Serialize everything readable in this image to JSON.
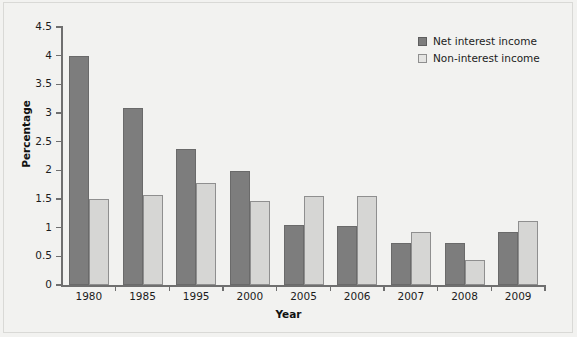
{
  "chart_data": {
    "type": "bar",
    "title": "",
    "xlabel": "Year",
    "ylabel": "Percentage",
    "categories": [
      "1980",
      "1985",
      "1995",
      "2000",
      "2005",
      "2006",
      "2007",
      "2008",
      "2009"
    ],
    "series": [
      {
        "name": "Net interest income",
        "color": "#7d7d7d",
        "values": [
          4.0,
          3.08,
          2.38,
          1.98,
          1.05,
          1.03,
          0.74,
          0.73,
          0.92
        ]
      },
      {
        "name": "Non-interest income",
        "color": "#d6d6d4",
        "values": [
          1.5,
          1.57,
          1.78,
          1.47,
          1.56,
          1.56,
          0.93,
          0.43,
          1.12
        ]
      }
    ],
    "ylim": [
      0,
      4.5
    ],
    "yticks": [
      "0",
      "0.5",
      "1",
      "1.5",
      "2",
      "2.5",
      "3",
      "3.5",
      "4",
      "4.5"
    ],
    "ytick_values": [
      0,
      0.5,
      1,
      1.5,
      2,
      2.5,
      3,
      3.5,
      4,
      4.5
    ],
    "grid": false,
    "legend_position": "top-right",
    "background_color": "#f2f2f0"
  }
}
